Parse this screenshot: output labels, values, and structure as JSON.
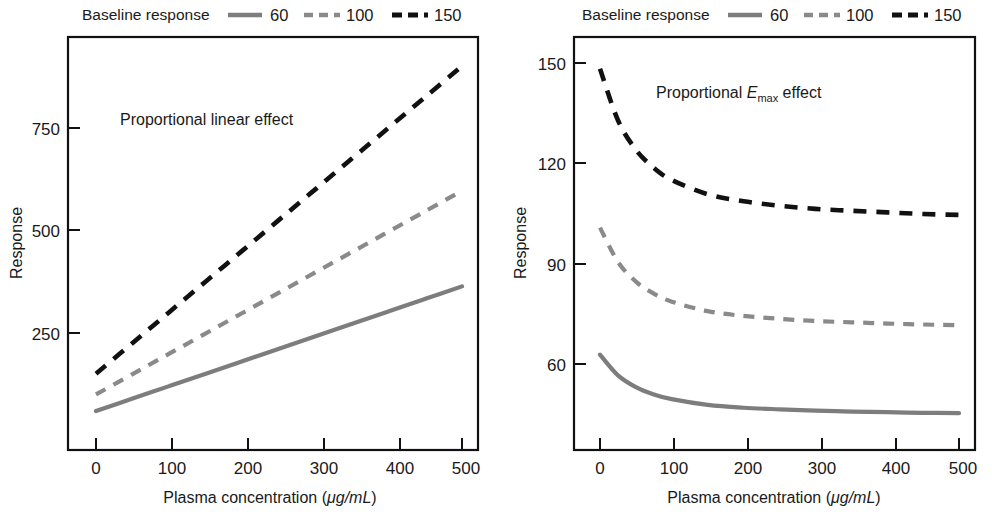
{
  "figure": {
    "background": "#ffffff",
    "ink_color": "#111111",
    "gray_color": "#8a8a8a"
  },
  "panels": [
    {
      "id": "left",
      "legend": {
        "title": "Baseline response",
        "entries": [
          {
            "label": "60",
            "style": "solid",
            "color": "#7d7d7d"
          },
          {
            "label": "100",
            "style": "dashed",
            "color": "#8a8a8a"
          },
          {
            "label": "150",
            "style": "dashed",
            "color": "#111111"
          }
        ]
      },
      "annotation": {
        "text": "Proportional linear effect"
      },
      "xlabel_a": "Plasma concentration (",
      "xlabel_unit": "μg/mL",
      "xlabel_b": ")",
      "ylabel": "Response",
      "xticks": [
        "0",
        "100",
        "200",
        "300",
        "400",
        "500"
      ],
      "yticks": [
        "250",
        "500",
        "750"
      ]
    },
    {
      "id": "right",
      "legend": {
        "title": "Baseline response",
        "entries": [
          {
            "label": "60",
            "style": "solid",
            "color": "#7d7d7d"
          },
          {
            "label": "100",
            "style": "dashed",
            "color": "#8a8a8a"
          },
          {
            "label": "150",
            "style": "dashed",
            "color": "#111111"
          }
        ]
      },
      "annotation": {
        "prefix": "Proportional ",
        "emphasis": "E",
        "subscript": "max",
        "suffix": " effect"
      },
      "xlabel_a": "Plasma concentration (",
      "xlabel_unit": "μg/mL",
      "xlabel_b": ")",
      "ylabel": "Response",
      "xticks": [
        "0",
        "100",
        "200",
        "300",
        "400",
        "500"
      ],
      "yticks": [
        "60",
        "90",
        "120",
        "150"
      ]
    }
  ],
  "chart_data": [
    {
      "type": "line",
      "title": "Proportional linear effect",
      "xlabel": "Plasma concentration (μg/mL)",
      "ylabel": "Response",
      "xlim": [
        0,
        520
      ],
      "ylim": [
        0,
        960
      ],
      "xticks": [
        0,
        100,
        200,
        300,
        400,
        500
      ],
      "yticks": [
        250,
        500,
        750
      ],
      "grid": false,
      "legend_title": "Baseline response",
      "legend_position": "above-plot",
      "x": [
        0,
        50,
        100,
        150,
        200,
        250,
        300,
        350,
        400,
        450,
        500
      ],
      "series": [
        {
          "name": "60",
          "style": "solid",
          "color": "#7d7d7d",
          "values": [
            60,
            90,
            120,
            150,
            180,
            210,
            240,
            270,
            300,
            330,
            360
          ]
        },
        {
          "name": "100",
          "style": "dashed",
          "color": "#8a8a8a",
          "values": [
            100,
            149,
            198,
            247,
            296,
            345,
            394,
            443,
            492,
            541,
            590
          ]
        },
        {
          "name": "150",
          "style": "dashed",
          "color": "#111111",
          "values": [
            150,
            224,
            298,
            372,
            446,
            520,
            594,
            668,
            742,
            816,
            890
          ]
        }
      ]
    },
    {
      "type": "line",
      "title": "Proportional Emax effect",
      "xlabel": "Plasma concentration (μg/mL)",
      "ylabel": "Response",
      "xlim": [
        0,
        520
      ],
      "ylim": [
        30,
        160
      ],
      "xticks": [
        0,
        100,
        200,
        300,
        400,
        500
      ],
      "yticks": [
        60,
        90,
        120,
        150
      ],
      "grid": false,
      "legend_title": "Baseline response",
      "legend_position": "above-plot",
      "x": [
        0,
        25,
        50,
        75,
        100,
        150,
        200,
        250,
        300,
        350,
        400,
        450,
        500
      ],
      "series": [
        {
          "name": "60",
          "style": "solid",
          "color": "#7d7d7d",
          "values": [
            60,
            53.5,
            49.8,
            47.5,
            46.0,
            44.2,
            43.3,
            42.8,
            42.4,
            42.1,
            41.9,
            41.7,
            41.6
          ]
        },
        {
          "name": "100",
          "style": "dashed",
          "color": "#8a8a8a",
          "values": [
            100,
            89.2,
            83.0,
            79.2,
            76.7,
            73.7,
            72.2,
            71.3,
            70.6,
            70.2,
            69.8,
            69.5,
            69.3
          ]
        },
        {
          "name": "150",
          "style": "dashed",
          "color": "#111111",
          "values": [
            150,
            133.8,
            124.5,
            118.8,
            115.0,
            110.5,
            108.3,
            106.9,
            105.9,
            105.3,
            104.8,
            104.3,
            104.0
          ]
        }
      ]
    }
  ]
}
